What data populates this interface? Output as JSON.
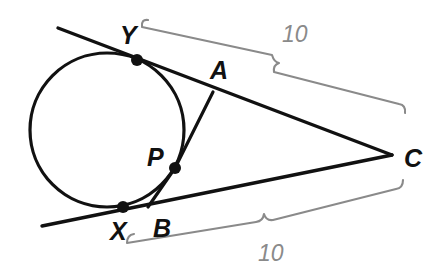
{
  "figure": {
    "background_color": "#ffffff",
    "stroke_color": "#111111",
    "brace_color": "#8a8a8a",
    "width": 437,
    "height": 269
  },
  "circle": {
    "label": "inscribed-circle",
    "center_x": 107,
    "center_y": 130,
    "radius": 77
  },
  "points": [
    {
      "id": "Y",
      "label": "Y",
      "x": 137,
      "y": 60,
      "label_x": 120,
      "label_y": 44,
      "dot": true
    },
    {
      "id": "A",
      "label": "A",
      "x": 213,
      "y": 92,
      "label_x": 210,
      "label_y": 79,
      "dot": false
    },
    {
      "id": "P",
      "label": "P",
      "x": 175,
      "y": 168,
      "label_x": 150,
      "label_y": 166,
      "dot": true
    },
    {
      "id": "X",
      "label": "X",
      "x": 123,
      "y": 207,
      "label_x": 112,
      "label_y": 239,
      "dot": true
    },
    {
      "id": "B",
      "label": "B",
      "x": 152,
      "y": 205,
      "label_x": 155,
      "label_y": 237,
      "dot": false
    },
    {
      "id": "C",
      "label": "C",
      "x": 392,
      "y": 155,
      "label_x": 405,
      "label_y": 166,
      "dot": false
    }
  ],
  "segments": [
    {
      "name": "upper-tangent-line",
      "from": "ray-start-upper",
      "to": "C",
      "x1": 58,
      "y1": 28,
      "x2": 392,
      "y2": 155
    },
    {
      "name": "lower-tangent-line",
      "from": "ray-start-lower",
      "to": "C",
      "x1": 42,
      "y1": 226,
      "x2": 392,
      "y2": 155
    },
    {
      "name": "segment-P-A",
      "from": "P",
      "to": "A",
      "x1": 175,
      "y1": 168,
      "x2": 213,
      "y2": 92
    },
    {
      "name": "segment-P-B",
      "from": "P",
      "to": "B",
      "x1": 175,
      "y1": 168,
      "x2": 148,
      "y2": 207
    }
  ],
  "measures": [
    {
      "name": "upper-brace",
      "value": "10",
      "from_point": "Y",
      "to_point": "C",
      "label_x": 288,
      "label_y": 41,
      "path": "M 148 20 q -7 -1 -6 7 L 272 55 q 2 7 7 8 q -6 2 -5 9 L 399 104 q 7 1 6 9"
    },
    {
      "name": "lower-brace",
      "value": "10",
      "from_point": "X",
      "to_point": "C",
      "label_x": 265,
      "label_y": 260,
      "path": "M 134 234 q -7 1 -7 9 L 256 222 q 7 -1 8 -8 q 2 7 9 6 L 396 189 q 7 -1 7 -9"
    }
  ]
}
